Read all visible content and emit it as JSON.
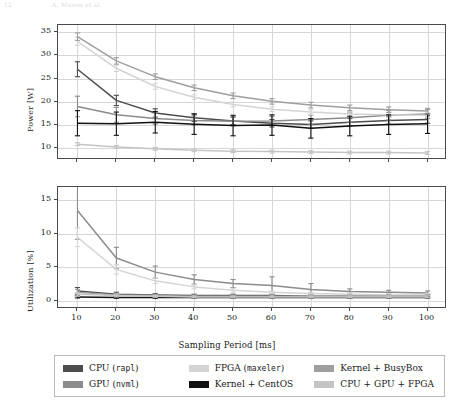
{
  "page_header": {
    "left": "12",
    "right": "A. Mason et al."
  },
  "chart_data": [
    {
      "type": "line",
      "id": "power-panel",
      "title": "",
      "xlabel": "Sampling Period [ms]",
      "ylabel": "Power [W]",
      "x": [
        10,
        20,
        30,
        40,
        50,
        60,
        70,
        80,
        90,
        100
      ],
      "xticks": [
        10,
        20,
        30,
        40,
        50,
        60,
        70,
        80,
        90,
        100
      ],
      "yticks": [
        10,
        15,
        20,
        25,
        30,
        35
      ],
      "xlim": [
        5,
        105
      ],
      "ylim": [
        7.5,
        36.5
      ],
      "grid": true,
      "errorbars": true,
      "series": [
        {
          "name": "CPU (rapl)",
          "color": "#4d4d4d",
          "values": [
            27.0,
            20.3,
            17.6,
            16.6,
            15.9,
            15.4,
            15.1,
            15.6,
            16.0,
            16.2
          ],
          "errors": [
            1.6,
            1.1,
            0.9,
            0.8,
            0.8,
            0.8,
            0.8,
            0.8,
            0.8,
            0.8
          ]
        },
        {
          "name": "GPU (nvml)",
          "color": "#8c8c8c",
          "values": [
            19.0,
            17.2,
            16.4,
            16.0,
            15.8,
            15.9,
            16.2,
            16.6,
            17.1,
            17.4
          ],
          "errors": [
            2.2,
            1.6,
            1.2,
            1.0,
            1.0,
            1.0,
            1.0,
            1.0,
            1.0,
            1.0
          ]
        },
        {
          "name": "FPGA (maxeler)",
          "color": "#d4d4d4",
          "values": [
            33.0,
            27.2,
            23.3,
            21.0,
            19.4,
            18.4,
            17.8,
            17.4,
            17.2,
            17.1
          ],
          "errors": [
            0.9,
            0.7,
            0.6,
            0.5,
            0.5,
            0.5,
            0.5,
            0.5,
            0.5,
            0.5
          ]
        },
        {
          "name": "Kernel + CentOS",
          "color": "#111111",
          "values": [
            15.4,
            15.3,
            15.6,
            15.2,
            14.9,
            15.0,
            14.3,
            14.8,
            15.1,
            15.3
          ],
          "errors": [
            2.7,
            2.5,
            2.3,
            2.2,
            2.2,
            2.2,
            2.1,
            2.1,
            2.1,
            2.1
          ]
        },
        {
          "name": "Kernel + BusyBox",
          "color": "#9e9e9e",
          "values": [
            34.0,
            28.8,
            25.4,
            23.0,
            21.3,
            20.1,
            19.3,
            18.7,
            18.3,
            18.0
          ],
          "errors": [
            0.8,
            0.7,
            0.6,
            0.6,
            0.6,
            0.6,
            0.6,
            0.6,
            0.6,
            0.6
          ]
        },
        {
          "name": "CPU + GPU + FPGA",
          "color": "#c4c4c4",
          "values": [
            10.9,
            10.3,
            9.9,
            9.6,
            9.4,
            9.3,
            9.2,
            9.1,
            9.1,
            9.0
          ],
          "errors": [
            0.3,
            0.3,
            0.3,
            0.3,
            0.3,
            0.3,
            0.3,
            0.3,
            0.3,
            0.3
          ]
        }
      ]
    },
    {
      "type": "line",
      "id": "utilization-panel",
      "title": "",
      "xlabel": "Sampling Period [ms]",
      "ylabel": "Utilization [%]",
      "x": [
        10,
        20,
        30,
        40,
        50,
        60,
        70,
        80,
        90,
        100
      ],
      "xticks": [
        10,
        20,
        30,
        40,
        50,
        60,
        70,
        80,
        90,
        100
      ],
      "yticks": [
        0,
        5,
        10,
        15
      ],
      "xlim": [
        5,
        105
      ],
      "ylim": [
        -1.2,
        17.0
      ],
      "grid": true,
      "errorbars": true,
      "series": [
        {
          "name": "CPU (rapl)",
          "color": "#4d4d4d",
          "values": [
            1.5,
            1.0,
            0.9,
            0.8,
            0.8,
            0.8,
            0.7,
            0.7,
            0.7,
            0.7
          ],
          "errors": [
            0.5,
            0.3,
            0.2,
            0.2,
            0.2,
            0.2,
            0.2,
            0.2,
            0.2,
            0.2
          ]
        },
        {
          "name": "GPU (nvml)",
          "color": "#8c8c8c",
          "values": [
            13.5,
            6.4,
            4.3,
            3.2,
            2.6,
            2.3,
            1.7,
            1.4,
            1.3,
            1.2
          ],
          "errors": [
            4.3,
            1.6,
            0.9,
            0.7,
            0.6,
            1.3,
            0.9,
            0.4,
            0.3,
            0.3
          ]
        },
        {
          "name": "FPGA (maxeler)",
          "color": "#d4d4d4",
          "values": [
            9.5,
            4.7,
            3.0,
            2.1,
            1.6,
            1.3,
            1.1,
            1.0,
            0.9,
            0.9
          ],
          "errors": [
            1.4,
            0.7,
            0.4,
            0.3,
            0.3,
            0.2,
            0.2,
            0.2,
            0.2,
            0.2
          ]
        },
        {
          "name": "Kernel + CentOS",
          "color": "#111111",
          "values": [
            0.6,
            0.5,
            0.5,
            0.5,
            0.5,
            0.5,
            0.5,
            0.5,
            0.5,
            0.5
          ],
          "errors": [
            0.15,
            0.1,
            0.1,
            0.1,
            0.1,
            0.1,
            0.1,
            0.1,
            0.1,
            0.1
          ]
        },
        {
          "name": "Kernel + BusyBox",
          "color": "#9e9e9e",
          "values": [
            1.3,
            0.9,
            0.8,
            0.7,
            0.7,
            0.7,
            0.7,
            0.7,
            0.7,
            0.7
          ],
          "errors": [
            0.4,
            0.25,
            0.2,
            0.2,
            0.2,
            0.2,
            0.2,
            0.2,
            0.2,
            0.2
          ]
        },
        {
          "name": "CPU + GPU + FPGA",
          "color": "#c4c4c4",
          "values": [
            1.0,
            0.8,
            0.7,
            0.6,
            0.6,
            0.6,
            0.6,
            0.6,
            0.6,
            0.6
          ],
          "errors": [
            0.3,
            0.2,
            0.15,
            0.15,
            0.15,
            0.15,
            0.15,
            0.15,
            0.15,
            0.15
          ]
        }
      ]
    }
  ],
  "legend": {
    "items": [
      {
        "label_plain": "CPU (",
        "label_mono": "rapl",
        "label_tail": ")",
        "color": "#4d4d4d"
      },
      {
        "label_plain": "FPGA (",
        "label_mono": "maxeler",
        "label_tail": ")",
        "color": "#d4d4d4"
      },
      {
        "label_plain": "Kernel + BusyBox",
        "label_mono": "",
        "label_tail": "",
        "color": "#9e9e9e"
      },
      {
        "label_plain": "GPU (",
        "label_mono": "nvml",
        "label_tail": ")",
        "color": "#8c8c8c"
      },
      {
        "label_plain": "Kernel + CentOS",
        "label_mono": "",
        "label_tail": "",
        "color": "#111111"
      },
      {
        "label_plain": "CPU + GPU + FPGA",
        "label_mono": "",
        "label_tail": "",
        "color": "#c4c4c4"
      }
    ]
  }
}
